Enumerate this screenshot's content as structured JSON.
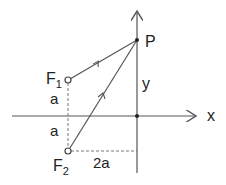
{
  "diagram": {
    "points": {
      "P": {
        "label": "P",
        "x": 137,
        "y": 40
      },
      "F1": {
        "label": "F",
        "sub": "1",
        "x": 68,
        "y": 80
      },
      "F2": {
        "label": "F",
        "sub": "2",
        "x": 68,
        "y": 151
      },
      "origin": {
        "x": 137,
        "y": 116
      }
    },
    "axes": {
      "x_label": "x",
      "y_label": "y"
    },
    "dimensions": {
      "upper_a": "a",
      "lower_a": "a",
      "horizontal": "2a"
    },
    "colors": {
      "line": "#555555",
      "text": "#222222"
    }
  }
}
